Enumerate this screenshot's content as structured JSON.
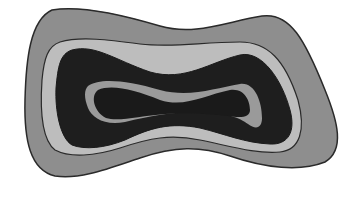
{
  "figure": {
    "layers": [
      {
        "name": "outer",
        "fill": "#8e8e8e"
      },
      {
        "name": "second",
        "fill": "#bdbdbd"
      },
      {
        "name": "third",
        "fill": "#1e1e1e"
      },
      {
        "name": "fourth",
        "fill": "#9a9a9a"
      },
      {
        "name": "core",
        "fill": "#1a1a1a"
      }
    ],
    "stroke": "#2a2a2a"
  }
}
